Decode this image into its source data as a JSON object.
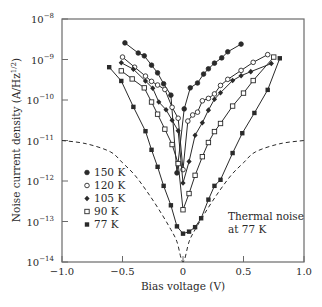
{
  "chart_data": {
    "type": "line",
    "title": "",
    "xlabel": "Bias voltage (V)",
    "ylabel": "Noise current density (A/Hz^1/2)",
    "xlim": [
      -1.0,
      1.0
    ],
    "ylim_log10": [
      -14,
      -8
    ],
    "yscale": "log",
    "grid": false,
    "x_ticks": [
      {
        "value": -1.0,
        "label": "−1.0"
      },
      {
        "value": -0.5,
        "label": "−0.5"
      },
      {
        "value": 0,
        "label": "0"
      },
      {
        "value": 0.5,
        "label": "0.5"
      },
      {
        "value": 1.0,
        "label": "1.0"
      }
    ],
    "y_ticks": [
      {
        "exp": -8,
        "base": "10",
        "sup": "−8"
      },
      {
        "exp": -9,
        "base": "10",
        "sup": "−9"
      },
      {
        "exp": -10,
        "base": "10",
        "sup": "−10"
      },
      {
        "exp": -11,
        "base": "10",
        "sup": "−11"
      },
      {
        "exp": -12,
        "base": "10",
        "sup": "−12"
      },
      {
        "exp": -13,
        "base": "10",
        "sup": "−13"
      },
      {
        "exp": -14,
        "base": "10",
        "sup": "−14"
      }
    ],
    "legend_position": "lower-left",
    "series": [
      {
        "name": "150 K",
        "marker": "filled-circle",
        "x": [
          -0.48,
          -0.37,
          -0.32,
          -0.26,
          -0.21,
          -0.16,
          -0.1,
          -0.05,
          0.01,
          0.06,
          0.12,
          0.17,
          0.21,
          0.26,
          0.32,
          0.37,
          0.48
        ],
        "log10_y": [
          -8.59,
          -8.84,
          -8.91,
          -9.14,
          -9.33,
          -9.6,
          -9.88,
          -11.8,
          -10.22,
          -9.7,
          -9.58,
          -9.36,
          -9.23,
          -9.09,
          -8.96,
          -8.81,
          -8.62
        ]
      },
      {
        "name": "120 K",
        "marker": "open-circle",
        "x": [
          -0.5,
          -0.4,
          -0.31,
          -0.26,
          -0.21,
          -0.15,
          -0.09,
          -0.04,
          0.0,
          0.04,
          0.08,
          0.12,
          0.16,
          0.21,
          0.26,
          0.31,
          0.37,
          0.48,
          0.58,
          0.7
        ],
        "log10_y": [
          -8.94,
          -9.19,
          -9.41,
          -9.54,
          -9.63,
          -9.74,
          -10.18,
          -10.45,
          -11.72,
          -10.52,
          -10.37,
          -10.3,
          -10.02,
          -9.96,
          -9.85,
          -9.64,
          -9.49,
          -9.27,
          -9.07,
          -8.88
        ],
        "note": "120 K right branch"
      },
      {
        "name": "105 K",
        "marker": "filled-diamond",
        "x": [
          -0.51,
          -0.41,
          -0.31,
          -0.25,
          -0.2,
          -0.14,
          -0.09,
          -0.04,
          0.0,
          0.05,
          0.1,
          0.16,
          0.21,
          0.26,
          0.31,
          0.41,
          0.48,
          0.56,
          0.73
        ],
        "log10_y": [
          -9.08,
          -9.24,
          -9.53,
          -9.71,
          -10.05,
          -10.24,
          -10.5,
          -10.76,
          -12.05,
          -11.52,
          -10.87,
          -10.56,
          -10.25,
          -9.98,
          -9.82,
          -9.52,
          -9.4,
          -9.3,
          -9.1
        ]
      },
      {
        "name": "90 K",
        "marker": "open-square",
        "x": [
          -0.51,
          -0.42,
          -0.32,
          -0.26,
          -0.21,
          -0.15,
          -0.09,
          -0.04,
          0.0,
          0.05,
          0.1,
          0.16,
          0.21,
          0.26,
          0.31,
          0.41,
          0.5,
          0.58,
          0.75
        ],
        "log10_y": [
          -9.28,
          -9.48,
          -9.7,
          -10.05,
          -10.35,
          -10.72,
          -11.1,
          -11.57,
          -12.71,
          -12.31,
          -11.86,
          -11.4,
          -11.05,
          -10.78,
          -10.58,
          -10.15,
          -9.83,
          -9.52,
          -8.94
        ]
      },
      {
        "name": "77 K",
        "marker": "filled-square",
        "x": [
          -0.61,
          -0.51,
          -0.41,
          -0.31,
          -0.26,
          -0.21,
          -0.16,
          -0.1,
          -0.05,
          0.0,
          0.05,
          0.1,
          0.15,
          0.21,
          0.26,
          0.31,
          0.41,
          0.49,
          0.59,
          0.7,
          0.8
        ],
        "log10_y": [
          -9.19,
          -9.53,
          -10.17,
          -10.77,
          -11.23,
          -11.65,
          -12.12,
          -12.6,
          -13.12,
          -13.3,
          -13.25,
          -13.14,
          -12.92,
          -12.46,
          -12.12,
          -11.97,
          -11.31,
          -10.82,
          -10.32,
          -9.75,
          -8.97
        ]
      },
      {
        "name": "Thermal noise at 77 K",
        "marker": "none",
        "style": "dashed",
        "x": [
          -1.0,
          -0.8,
          -0.6,
          -0.5,
          -0.4,
          -0.3,
          -0.2,
          -0.1,
          -0.05,
          0.0,
          0.05,
          0.1,
          0.2,
          0.3,
          0.4,
          0.5,
          0.6,
          0.8,
          1.0
        ],
        "log10_y": [
          -11.0,
          -11.08,
          -11.28,
          -11.55,
          -11.85,
          -12.25,
          -12.7,
          -13.2,
          -13.5,
          -14.0,
          -13.5,
          -13.2,
          -12.7,
          -12.25,
          -11.85,
          -11.55,
          -11.28,
          -11.08,
          -11.0
        ]
      }
    ],
    "legend": [
      {
        "label": "150 K",
        "marker": "filled-circle"
      },
      {
        "label": "120 K",
        "marker": "open-circle"
      },
      {
        "label": "105 K",
        "marker": "filled-diamond"
      },
      {
        "label": "90 K",
        "marker": "open-square"
      },
      {
        "label": "77 K",
        "marker": "filled-square"
      }
    ],
    "annotation": {
      "line1": "Thermal noise",
      "line2": "at 77 K"
    }
  },
  "axes": {
    "xlabel": "Bias voltage (V)",
    "ylabel_main": "Noise current density (A/Hz",
    "ylabel_sup": "1/2",
    "ylabel_close": ")"
  }
}
